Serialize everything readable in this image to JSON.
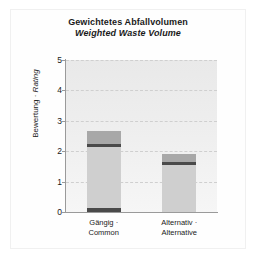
{
  "chart_data": {
    "type": "bar",
    "title": "Gewichtetes Abfallvolumen",
    "subtitle": "Weighted Waste Volume",
    "xlabel": "",
    "ylabel_de": "Bewertung",
    "ylabel_sep": " · ",
    "ylabel_en": "Rating",
    "ylim": [
      0,
      5
    ],
    "yticks": [
      0,
      1,
      2,
      3,
      4,
      5
    ],
    "grid": true,
    "legend": "none",
    "categories": [
      {
        "line1": "Gängig ·",
        "line2": "Common"
      },
      {
        "line1": "Alternativ ·",
        "line2": "Alternative"
      }
    ],
    "stacked": true,
    "series": [
      {
        "name": "base",
        "color": "#4a4a4a",
        "values": [
          0.12,
          0.0
        ]
      },
      {
        "name": "body",
        "color": "#cfcfcf",
        "values": [
          2.03,
          1.55
        ]
      },
      {
        "name": "band",
        "color": "#4a4a4a",
        "values": [
          0.1,
          0.1
        ]
      },
      {
        "name": "cap",
        "color": "#a8a8a8",
        "values": [
          0.4,
          0.25
        ]
      }
    ],
    "totals": [
      2.65,
      1.9
    ]
  },
  "colors": {
    "plot_background": "#eeeeee",
    "gridline": "#cfcfcf",
    "axis": "#9a9a9a",
    "text": "#1a1a1a",
    "page_background": "#ffffff",
    "frame": "#f0f0f0"
  }
}
